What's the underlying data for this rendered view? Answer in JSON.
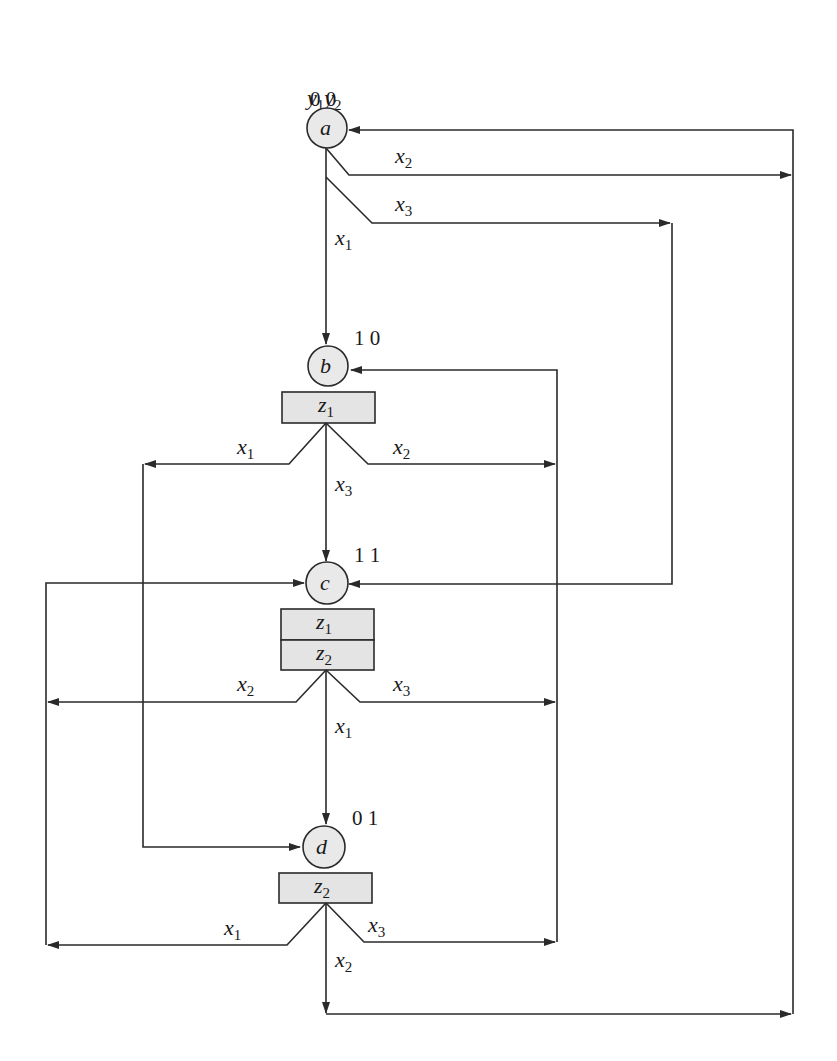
{
  "diagram": {
    "type": "ASM state diagram (Moore outputs)",
    "header": {
      "state_vars": [
        {
          "name": "y",
          "sub": "1"
        },
        {
          "name": "y",
          "sub": "2"
        }
      ]
    },
    "states": [
      {
        "id": "a",
        "label": "a",
        "code": "0 0",
        "outputs": []
      },
      {
        "id": "b",
        "label": "b",
        "code": "1 0",
        "outputs": [
          {
            "name": "z",
            "sub": "1"
          }
        ]
      },
      {
        "id": "c",
        "label": "c",
        "code": "1 1",
        "outputs": [
          {
            "name": "z",
            "sub": "1"
          },
          {
            "name": "z",
            "sub": "2"
          }
        ]
      },
      {
        "id": "d",
        "label": "d",
        "code": "0 1",
        "outputs": [
          {
            "name": "z",
            "sub": "2"
          }
        ]
      }
    ],
    "transitions": [
      {
        "from": "a",
        "to": "b",
        "input": {
          "name": "x",
          "sub": "1"
        }
      },
      {
        "from": "a",
        "to": "a",
        "input": {
          "name": "x",
          "sub": "2"
        }
      },
      {
        "from": "a",
        "to": "c",
        "input": {
          "name": "x",
          "sub": "3"
        }
      },
      {
        "from": "b",
        "to": "d",
        "input": {
          "name": "x",
          "sub": "1"
        }
      },
      {
        "from": "b",
        "to": "b",
        "input": {
          "name": "x",
          "sub": "2"
        }
      },
      {
        "from": "b",
        "to": "c",
        "input": {
          "name": "x",
          "sub": "3"
        }
      },
      {
        "from": "c",
        "to": "d",
        "input": {
          "name": "x",
          "sub": "1"
        }
      },
      {
        "from": "c",
        "to": "c",
        "input": {
          "name": "x",
          "sub": "2"
        }
      },
      {
        "from": "c",
        "to": "b",
        "input": {
          "name": "x",
          "sub": "3"
        }
      },
      {
        "from": "d",
        "to": "c",
        "input": {
          "name": "x",
          "sub": "1"
        }
      },
      {
        "from": "d",
        "to": "a",
        "input": {
          "name": "x",
          "sub": "2"
        }
      },
      {
        "from": "d",
        "to": "b",
        "input": {
          "name": "x",
          "sub": "3"
        }
      }
    ]
  },
  "colors": {
    "stroke": "#2a2a2a",
    "node_fill": "#e9e9e9",
    "box_fill": "#e4e4e4",
    "background": "#ffffff"
  }
}
